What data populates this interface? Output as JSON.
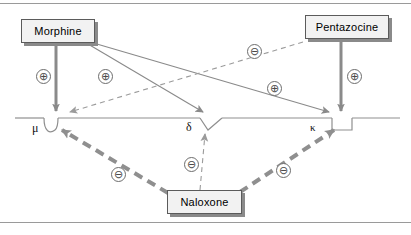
{
  "figure": {
    "colors": {
      "membrane_line": "#8f8f8f",
      "solid_arrow": "#8a8a8a",
      "thick_dashed_arrow": "#8f8f8f",
      "thin_dashed_arrow": "#a0a0a0",
      "box_fill": "#f2f2f2",
      "box_border": "#5b5b5b",
      "box_shadow": "#8a8a8a",
      "rule": "#9a9a9a",
      "sign_stroke": "#6d6d6d"
    }
  },
  "drugs": [
    {
      "id": "morphine",
      "label": "Morphine"
    },
    {
      "id": "pentazocine",
      "label": "Pentazocine"
    },
    {
      "id": "naloxone",
      "label": "Naloxone"
    }
  ],
  "receptors": [
    {
      "id": "mu",
      "label": "μ",
      "name": "mu-receptor",
      "shape": "rounded-notch"
    },
    {
      "id": "delta",
      "label": "δ",
      "name": "delta-receptor",
      "shape": "v-notch"
    },
    {
      "id": "kappa",
      "label": "κ",
      "name": "kappa-receptor",
      "shape": "square-notch"
    }
  ],
  "signs": {
    "plus": "⊕",
    "minus": "⊖"
  },
  "interactions": [
    {
      "from": "morphine",
      "to": "mu",
      "sign": "⊕",
      "style": "solid-thick",
      "effect": "agonist"
    },
    {
      "from": "morphine",
      "to": "delta",
      "sign": "⊕",
      "style": "solid-thin",
      "effect": "agonist"
    },
    {
      "from": "morphine",
      "to": "kappa",
      "sign": "⊕",
      "style": "solid-thin",
      "effect": "agonist"
    },
    {
      "from": "pentazocine",
      "to": "kappa",
      "sign": "⊕",
      "style": "solid-thick",
      "effect": "agonist"
    },
    {
      "from": "pentazocine",
      "to": "mu",
      "sign": "⊖",
      "style": "dashed-thin",
      "effect": "antagonist"
    },
    {
      "from": "naloxone",
      "to": "mu",
      "sign": "⊖",
      "style": "dashed-thick",
      "effect": "antagonist"
    },
    {
      "from": "naloxone",
      "to": "delta",
      "sign": "⊖",
      "style": "dashed-thin",
      "effect": "antagonist"
    },
    {
      "from": "naloxone",
      "to": "kappa",
      "sign": "⊖",
      "style": "dashed-thick",
      "effect": "antagonist"
    }
  ],
  "sign_markers": [
    {
      "id": "morphine-mu-plus",
      "text": "⊕"
    },
    {
      "id": "morphine-delta-plus",
      "text": "⊕"
    },
    {
      "id": "morphine-kappa-plus",
      "text": "⊕"
    },
    {
      "id": "pentazocine-kappa-plus",
      "text": "⊕"
    },
    {
      "id": "pentazocine-mu-minus",
      "text": "⊖"
    },
    {
      "id": "naloxone-mu-minus",
      "text": "⊖"
    },
    {
      "id": "naloxone-delta-minus",
      "text": "⊖"
    },
    {
      "id": "naloxone-kappa-minus",
      "text": "⊖"
    }
  ]
}
